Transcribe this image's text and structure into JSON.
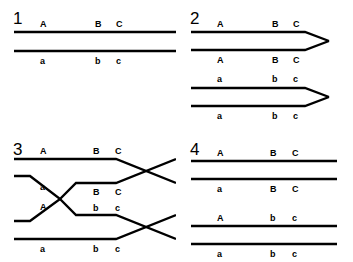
{
  "figure": {
    "stroke_color": "#000000",
    "background_color": "#ffffff",
    "width": 353,
    "height": 262
  },
  "panels": [
    {
      "number": "1",
      "name": "paired-homologous-chromosomes",
      "shape": "straight-lines",
      "chromatids": [
        {
          "name": "chromatid-1",
          "label_position": "above",
          "alleles": [
            "A",
            "B",
            "C"
          ]
        },
        {
          "name": "chromatid-2",
          "label_position": "below",
          "alleles": [
            "a",
            "b",
            "c"
          ]
        }
      ]
    },
    {
      "number": "2",
      "name": "replicated-sister-chromatids",
      "shape": "arrow-lines",
      "chromatids": [
        {
          "name": "chromatid-1",
          "label_position": "above",
          "alleles": [
            "A",
            "B",
            "C"
          ]
        },
        {
          "name": "chromatid-2",
          "label_position": "below",
          "alleles": [
            "A",
            "B",
            "C"
          ]
        },
        {
          "name": "chromatid-3",
          "label_position": "above",
          "alleles": [
            "a",
            "b",
            "c"
          ]
        },
        {
          "name": "chromatid-4",
          "label_position": "below",
          "alleles": [
            "a",
            "b",
            "c"
          ]
        }
      ]
    },
    {
      "number": "3",
      "name": "crossing-over",
      "shape": "crossed-lines",
      "chromatids": [
        {
          "name": "chromatid-1",
          "label_position": "above",
          "alleles": [
            "A",
            "B",
            "C"
          ]
        },
        {
          "name": "chromatid-2",
          "label_position": "below",
          "alleles": [
            "a",
            "B",
            "C"
          ]
        },
        {
          "name": "chromatid-3",
          "label_position": "above",
          "alleles": [
            "A",
            "b",
            "c"
          ]
        },
        {
          "name": "chromatid-4",
          "label_position": "below",
          "alleles": [
            "a",
            "b",
            "c"
          ]
        }
      ]
    },
    {
      "number": "4",
      "name": "recombinant-products",
      "shape": "straight-lines",
      "chromatids": [
        {
          "name": "chromatid-1",
          "label_position": "above",
          "alleles": [
            "A",
            "B",
            "C"
          ]
        },
        {
          "name": "chromatid-2",
          "label_position": "below",
          "alleles": [
            "a",
            "B",
            "C"
          ]
        },
        {
          "name": "chromatid-3",
          "label_position": "above",
          "alleles": [
            "A",
            "b",
            "c"
          ]
        },
        {
          "name": "chromatid-4",
          "label_position": "below",
          "alleles": [
            "a",
            "b",
            "c"
          ]
        }
      ]
    }
  ]
}
